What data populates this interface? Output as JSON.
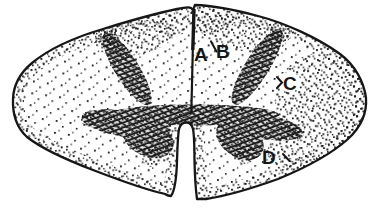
{
  "colors": {
    "ink": "#161616",
    "background": "#ffffff"
  },
  "figure": {
    "labels": [
      {
        "id": "A",
        "text": "A"
      },
      {
        "id": "B",
        "text": "B"
      },
      {
        "id": "C",
        "text": "C"
      },
      {
        "id": "D",
        "text": "D"
      }
    ]
  }
}
